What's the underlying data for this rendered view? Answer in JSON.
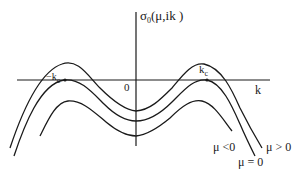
{
  "diagram": {
    "type": "dispersion-curve-sketch",
    "axes": {
      "vertical_label": "σ₀(μ,ik )",
      "vertical_label_base": "σ",
      "vertical_label_sub": "0",
      "vertical_label_args": "(μ,ik )",
      "horizontal_label": "k",
      "origin_label": "0"
    },
    "markers": {
      "neg_kc": {
        "prefix": "−k",
        "sub": "c"
      },
      "pos_kc": {
        "prefix": "k",
        "sub": "c"
      }
    },
    "curves": [
      {
        "id": "mu-positive",
        "label": "μ > 0",
        "description": "peaks cross above the k-axis"
      },
      {
        "id": "mu-zero",
        "label": "μ = 0",
        "description": "peaks tangent to the k-axis at ±k_c"
      },
      {
        "id": "mu-negative",
        "label": "μ <0",
        "description": "entirely below the k-axis"
      }
    ],
    "colors": {
      "line": "#1a1a1a",
      "background": "#ffffff"
    }
  }
}
